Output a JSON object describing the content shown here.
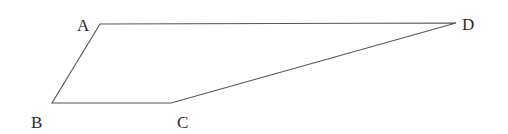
{
  "diagram": {
    "type": "quadrilateral",
    "stroke_color": "#555555",
    "label_color": "#2a2a2a",
    "vertices": [
      {
        "name": "A",
        "x": 100,
        "y": 24,
        "label_x": 77,
        "label_y": 17
      },
      {
        "name": "B",
        "x": 52,
        "y": 103,
        "label_x": 31,
        "label_y": 114
      },
      {
        "name": "C",
        "x": 171,
        "y": 103,
        "label_x": 177,
        "label_y": 114
      },
      {
        "name": "D",
        "x": 456,
        "y": 23,
        "label_x": 462,
        "label_y": 16
      }
    ],
    "edges": [
      [
        "A",
        "D"
      ],
      [
        "D",
        "C"
      ],
      [
        "C",
        "B"
      ],
      [
        "B",
        "A"
      ]
    ]
  }
}
